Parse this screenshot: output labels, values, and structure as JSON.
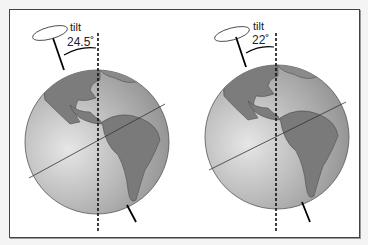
{
  "figure": {
    "panels": [
      {
        "id": "left",
        "tilt_label": "tilt",
        "angle_label": "24.5˚",
        "angle_deg": 24.5
      },
      {
        "id": "right",
        "tilt_label": "tilt",
        "angle_label": "22˚",
        "angle_deg": 22
      }
    ],
    "colors": {
      "ocean": "#9a9a9a",
      "land": "#7a7a7a",
      "frame": "#444444",
      "background": "#ffffff"
    }
  }
}
